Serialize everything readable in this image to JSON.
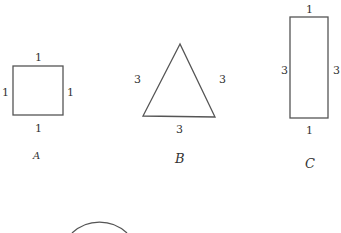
{
  "shapes": {
    "A": {
      "caption": "A",
      "type": "square",
      "sides": {
        "top": "1",
        "left": "1",
        "right": "1",
        "bottom": "1"
      }
    },
    "B": {
      "caption": "B",
      "type": "triangle",
      "sides": {
        "left": "3",
        "right": "3",
        "bottom": "3"
      }
    },
    "C": {
      "caption": "C",
      "type": "rectangle",
      "sides": {
        "top": "1",
        "left": "3",
        "right": "3",
        "bottom": "1"
      }
    },
    "D": {
      "type": "circle",
      "partial": true
    }
  },
  "colors": {
    "stroke": "#555555",
    "text": "#333333"
  }
}
